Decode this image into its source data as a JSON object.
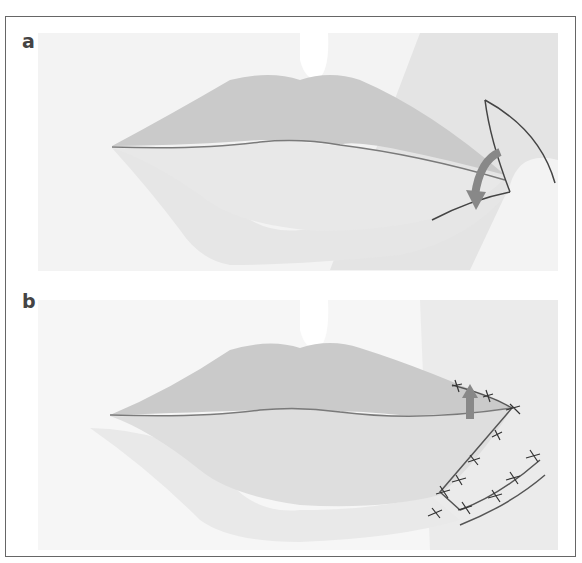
{
  "figure": {
    "panels": [
      {
        "label": "a",
        "description": "Lips with wedge-shaped flap outlined at right commissure; curved arrow indicating rotation of flap"
      },
      {
        "label": "b",
        "description": "Flap rotated and sutured in place; arrow indicating upward advancement; interrupted sutures along incision lines"
      }
    ],
    "colors": {
      "frame": "#666666",
      "skin_bg": "#f1f1f1",
      "lip_upper": "#c8c8c8",
      "lip_lower": "#e0e0e0",
      "lip_line": "#7a7a7a",
      "arrow": "#888888",
      "incision": "#444444"
    }
  }
}
